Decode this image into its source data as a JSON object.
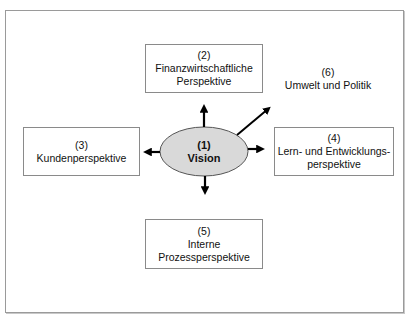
{
  "diagram": {
    "center": {
      "number": "(1)",
      "label": "Vision",
      "fill": "#d9d9d9"
    },
    "nodes": [
      {
        "id": "2",
        "number": "(2)",
        "lines": [
          "Finanzwirtschaftliche",
          "Perspektive"
        ]
      },
      {
        "id": "3",
        "number": "(3)",
        "lines": [
          "Kundenperspektive"
        ]
      },
      {
        "id": "4",
        "number": "(4)",
        "lines": [
          "Lern- und Entwicklungs-",
          "perspektive"
        ]
      },
      {
        "id": "5",
        "number": "(5)",
        "lines": [
          "Interne",
          "Prozessperspektive"
        ]
      },
      {
        "id": "6",
        "number": "(6)",
        "lines": [
          "Umwelt und Politik"
        ]
      }
    ],
    "edges": [
      {
        "from": "1",
        "to": "2",
        "direction": "up"
      },
      {
        "from": "1",
        "to": "3",
        "direction": "left"
      },
      {
        "from": "1",
        "to": "4",
        "direction": "right"
      },
      {
        "from": "1",
        "to": "5",
        "direction": "down"
      },
      {
        "from": "1",
        "to": "6",
        "direction": "up-right"
      }
    ],
    "colors": {
      "border": "#8a8a8a",
      "arrow": "#000000",
      "frame": "#9a9a9a"
    }
  }
}
